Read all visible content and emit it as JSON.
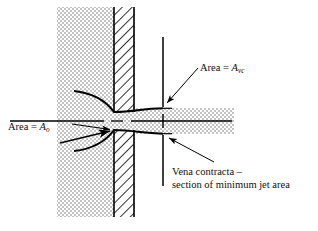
{
  "figure": {
    "type": "diagram",
    "background_color": "#ffffff",
    "line_color": "#000000",
    "fluid_fill_color": "#d9d9d9",
    "wall_hatch_color": "#000000"
  },
  "labels": {
    "area_vc": {
      "text": "Area = ",
      "symbol": "A",
      "subscript": "vc"
    },
    "area_o": {
      "text": "Area = ",
      "symbol": "A",
      "subscript": "o"
    },
    "vena_contracta_line1": "Vena contracta –",
    "vena_contracta_line2": "section of minimum jet area"
  },
  "geometry": {
    "fluid_region": {
      "x": 57,
      "y": 7,
      "width": 78,
      "height": 210
    },
    "wall": {
      "x": 113,
      "y": 7,
      "width": 22,
      "height": 210
    },
    "orifice_center_y": 121,
    "orifice_half_height": 9,
    "centerline": {
      "x1": 10,
      "x2": 232,
      "y": 121
    },
    "jet_band": {
      "x1": 135,
      "x2": 234,
      "top": 108,
      "bottom": 134
    },
    "vena_contracta_x": 163,
    "section_line": {
      "x": 163,
      "y_top": 37,
      "y_bottom": 186
    }
  },
  "leaders": {
    "avc_arrow": {
      "from_x": 198,
      "from_y": 68,
      "to_x": 166,
      "to_y": 104
    },
    "ao_arrow_upper": {
      "from_x": 72,
      "from_y": 124,
      "to_x": 112,
      "to_y": 130
    },
    "ao_arrow_lower": {
      "from_x": 62,
      "from_y": 142,
      "to_x": 112,
      "to_y": 131
    },
    "vc_arrow": {
      "from_x": 214,
      "from_y": 163,
      "to_x": 168,
      "to_y": 139
    }
  }
}
